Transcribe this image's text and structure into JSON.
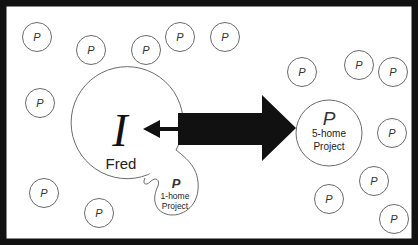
{
  "diagram": {
    "colors": {
      "border": "#111111",
      "background": "#ffffff",
      "circle_stroke": "#6b6b6b",
      "arrow": "#111111",
      "text": "#222222"
    },
    "person": {
      "symbol": "I",
      "name": "Fred"
    },
    "one_home_project": {
      "symbol": "P",
      "line1": "1-home",
      "line2": "Project"
    },
    "five_home_project": {
      "symbol": "P",
      "line1": "5-home",
      "line2": "Project"
    },
    "projects": [
      {
        "label": "P",
        "cx": 37,
        "cy": 37
      },
      {
        "label": "P",
        "cx": 91,
        "cy": 50
      },
      {
        "label": "P",
        "cx": 146,
        "cy": 50
      },
      {
        "label": "P",
        "cx": 180,
        "cy": 37
      },
      {
        "label": "P",
        "cx": 225,
        "cy": 37
      },
      {
        "label": "P",
        "cx": 40,
        "cy": 103
      },
      {
        "label": "P",
        "cx": 302,
        "cy": 72
      },
      {
        "label": "P",
        "cx": 359,
        "cy": 65
      },
      {
        "label": "P",
        "cx": 393,
        "cy": 72
      },
      {
        "label": "P",
        "cx": 392,
        "cy": 133
      },
      {
        "label": "P",
        "cx": 374,
        "cy": 181
      },
      {
        "label": "P",
        "cx": 329,
        "cy": 199
      },
      {
        "label": "P",
        "cx": 394,
        "cy": 219
      },
      {
        "label": "P",
        "cx": 44,
        "cy": 193
      },
      {
        "label": "P",
        "cx": 99,
        "cy": 213
      }
    ]
  }
}
